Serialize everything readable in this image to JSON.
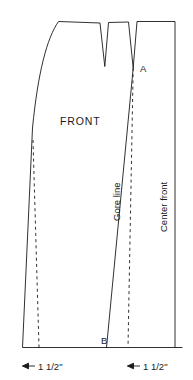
{
  "diagram": {
    "piece_label": "FRONT",
    "point_a": "A",
    "point_b": "B",
    "gore_line_label": "Gore line",
    "center_front_label": "Center front",
    "line_color": "#1a1a1a",
    "background_color": "#ffffff",
    "dimensions": [
      {
        "id": "left",
        "value": "1 1/2\"",
        "arrow": "left-arrow-icon"
      },
      {
        "id": "right",
        "value": "1 1/2\"",
        "arrow": "left-arrow-icon"
      }
    ]
  },
  "geometry": {
    "outline_note": "side seam curve, waist with two darts, center front straight edge, hem baseline",
    "dart_count": 2,
    "dashed_line_count": 2
  }
}
